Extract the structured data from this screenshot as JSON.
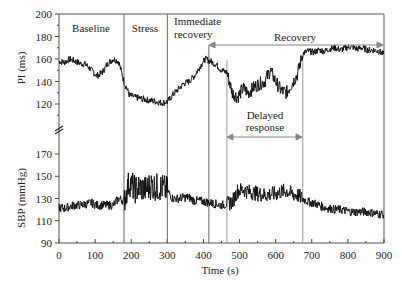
{
  "chart_data": {
    "type": "line",
    "title": "",
    "xlabel": "Time (s)",
    "xlim": [
      0,
      900
    ],
    "x_ticks": [
      0,
      100,
      200,
      300,
      400,
      500,
      600,
      700,
      800,
      900
    ],
    "grid": false,
    "panels": [
      {
        "name": "PI",
        "ylabel": "PI (ms)",
        "ylim": [
          100,
          200
        ],
        "y_ticks": [
          120,
          140,
          160,
          180,
          200
        ],
        "axis_break_below": true,
        "series": [
          {
            "name": "PI",
            "x": [
              0,
              15,
              30,
              45,
              60,
              75,
              90,
              105,
              120,
              135,
              150,
              165,
              180,
              195,
              210,
              225,
              240,
              255,
              270,
              285,
              300,
              315,
              330,
              345,
              360,
              375,
              390,
              405,
              420,
              435,
              450,
              465,
              480,
              495,
              510,
              525,
              540,
              555,
              570,
              585,
              600,
              615,
              630,
              645,
              660,
              675,
              690,
              705,
              720,
              735,
              750,
              765,
              780,
              795,
              810,
              825,
              840,
              855,
              870,
              885,
              900
            ],
            "values": [
              158,
              157,
              160,
              158,
              156,
              155,
              150,
              145,
              148,
              156,
              160,
              158,
              140,
              128,
              126,
              125,
              124,
              123,
              122,
              121,
              122,
              128,
              133,
              138,
              140,
              145,
              153,
              160,
              158,
              155,
              150,
              148,
              130,
              126,
              134,
              130,
              135,
              138,
              140,
              150,
              140,
              132,
              130,
              138,
              146,
              165,
              167,
              166,
              168,
              167,
              169,
              170,
              168,
              170,
              171,
              169,
              170,
              168,
              168,
              167,
              164
            ]
          }
        ]
      },
      {
        "name": "SBP",
        "ylabel": "SBP (mmHg)",
        "ylim": [
          90,
          180
        ],
        "y_ticks": [
          90,
          110,
          130,
          150,
          170
        ],
        "series": [
          {
            "name": "SBP",
            "x": [
              0,
              15,
              30,
              45,
              60,
              75,
              90,
              105,
              120,
              135,
              150,
              165,
              180,
              195,
              210,
              225,
              240,
              255,
              270,
              285,
              300,
              315,
              330,
              345,
              360,
              375,
              390,
              405,
              420,
              435,
              450,
              465,
              480,
              495,
              510,
              525,
              540,
              555,
              570,
              585,
              600,
              615,
              630,
              645,
              660,
              675,
              690,
              705,
              720,
              735,
              750,
              765,
              780,
              795,
              810,
              825,
              840,
              855,
              870,
              885,
              900
            ],
            "values": [
              122,
              121,
              123,
              124,
              124,
              125,
              126,
              124,
              124,
              124,
              124,
              130,
              128,
              145,
              138,
              140,
              138,
              142,
              140,
              140,
              137,
              130,
              130,
              131,
              131,
              128,
              128,
              127,
              126,
              125,
              124,
              125,
              127,
              137,
              138,
              136,
              135,
              134,
              133,
              134,
              134,
              136,
              137,
              134,
              133,
              130,
              127,
              126,
              124,
              122,
              121,
              120,
              120,
              119,
              118,
              118,
              118,
              118,
              117,
              116,
              116
            ]
          }
        ]
      }
    ],
    "phase_lines_x": [
      180,
      300,
      415,
      465,
      675
    ],
    "annotations": [
      {
        "text": "Baseline",
        "x": 75
      },
      {
        "text": "Stress",
        "x": 240
      },
      {
        "text": "Immediate recovery",
        "x": 355
      },
      {
        "text": "Recovery",
        "x": 660,
        "span": [
          415,
          900
        ]
      },
      {
        "text": "Delayed response",
        "x": 570,
        "span": [
          465,
          675
        ]
      }
    ]
  },
  "labels": {
    "ylabel_pi": "PI (ms)",
    "ylabel_sbp": "SBP (mmHg)",
    "xlabel": "Time (s)",
    "baseline": "Baseline",
    "stress": "Stress",
    "immediate_1": "Immediate",
    "immediate_2": "recovery",
    "recovery": "Recovery",
    "delayed_1": "Delayed",
    "delayed_2": "response"
  }
}
